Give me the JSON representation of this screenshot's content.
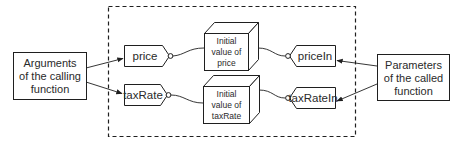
{
  "diagram": {
    "type": "argument-to-parameter passing diagram",
    "colors": {
      "stroke": "#1f1f1f",
      "text": "#2a2a2a",
      "background": "#ffffff"
    },
    "caller_box": {
      "line1": "Arguments",
      "line2": "of the calling",
      "line3": "function"
    },
    "callee_box": {
      "line1": "Parameters",
      "line2": "of the called",
      "line3": "function"
    },
    "arguments": [
      {
        "label": "price"
      },
      {
        "label": "taxRate"
      }
    ],
    "values": [
      {
        "line1": "Initial",
        "line2": "value of",
        "line3": "price"
      },
      {
        "line1": "Initial",
        "line2": "value of",
        "line3": "taxRate"
      }
    ],
    "parameters": [
      {
        "label": "priceIn"
      },
      {
        "label": "taxRateIn"
      }
    ]
  }
}
